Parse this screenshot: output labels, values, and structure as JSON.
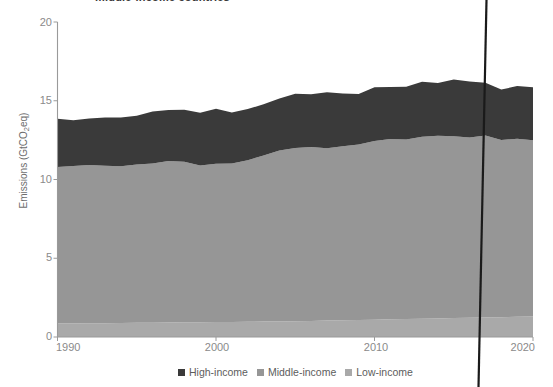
{
  "title": "middle-income countries",
  "axes": {
    "ylabel_text": "Emissions (GtCO",
    "ylabel_sub": "2",
    "ylabel_tail": "eq)",
    "yticks": [
      "0",
      "5",
      "10",
      "15",
      "20"
    ],
    "xticks": [
      "1990",
      "2000",
      "2010",
      "2020"
    ]
  },
  "legend": {
    "items": [
      {
        "label": "High-income",
        "color": "#3a3a3a"
      },
      {
        "label": "Middle-income",
        "color": "#969696"
      },
      {
        "label": "Low-income",
        "color": "#a9a9a9"
      }
    ]
  },
  "colors": {
    "high": "#3a3a3a",
    "middle": "#969696",
    "low": "#a9a9a9",
    "axis": "#9a9a9a",
    "text": "#8a8a8a",
    "artifact": "#1a1a1a"
  },
  "chart_data": {
    "type": "area",
    "stacked": true,
    "title": "middle-income countries",
    "xlabel": "",
    "ylabel": "Emissions (GtCO2eq)",
    "xlim": [
      1990,
      2020
    ],
    "ylim": [
      0,
      20
    ],
    "grid": false,
    "legend_position": "bottom",
    "x": [
      1990,
      1991,
      1992,
      1993,
      1994,
      1995,
      1996,
      1997,
      1998,
      1999,
      2000,
      2001,
      2002,
      2003,
      2004,
      2005,
      2006,
      2007,
      2008,
      2009,
      2010,
      2011,
      2012,
      2013,
      2014,
      2015,
      2016,
      2017,
      2018,
      2019,
      2020
    ],
    "series": [
      {
        "name": "Low-income",
        "color": "#a9a9a9",
        "values": [
          0.85,
          0.86,
          0.87,
          0.88,
          0.89,
          0.9,
          0.91,
          0.92,
          0.93,
          0.94,
          0.95,
          0.96,
          0.97,
          0.98,
          0.99,
          1.0,
          1.02,
          1.04,
          1.06,
          1.08,
          1.1,
          1.12,
          1.14,
          1.16,
          1.18,
          1.2,
          1.22,
          1.24,
          1.26,
          1.28,
          1.3
        ]
      },
      {
        "name": "Middle-income",
        "color": "#969696",
        "values": [
          9.95,
          10.0,
          10.05,
          10.0,
          9.95,
          10.05,
          10.1,
          10.25,
          10.2,
          9.95,
          10.05,
          10.05,
          10.25,
          10.55,
          10.85,
          11.0,
          11.05,
          10.95,
          11.05,
          11.15,
          11.35,
          11.45,
          11.4,
          11.55,
          11.6,
          11.55,
          11.45,
          11.55,
          11.25,
          11.3,
          11.2
        ]
      },
      {
        "name": "High-income",
        "color": "#3a3a3a",
        "values": [
          3.05,
          2.9,
          2.95,
          3.05,
          3.1,
          3.1,
          3.3,
          3.25,
          3.3,
          3.35,
          3.5,
          3.25,
          3.25,
          3.25,
          3.3,
          3.45,
          3.35,
          3.55,
          3.35,
          3.2,
          3.4,
          3.3,
          3.35,
          3.5,
          3.35,
          3.6,
          3.55,
          3.35,
          3.2,
          3.35,
          3.35
        ]
      }
    ],
    "totals": [
      13.85,
      13.76,
      13.87,
      13.93,
      13.94,
      14.05,
      14.31,
      14.41,
      14.43,
      14.24,
      14.5,
      14.26,
      14.47,
      14.78,
      15.14,
      15.45,
      15.42,
      15.54,
      15.46,
      15.43,
      15.85,
      15.87,
      15.89,
      16.21,
      16.13,
      16.35,
      16.22,
      16.14,
      15.71,
      15.93,
      15.85
    ]
  }
}
